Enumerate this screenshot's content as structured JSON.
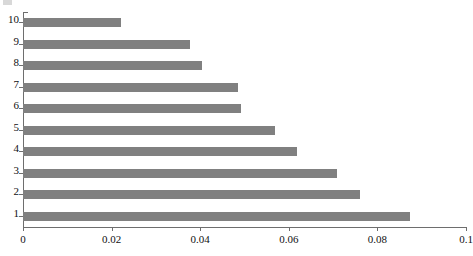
{
  "chart_data": {
    "type": "bar",
    "orientation": "horizontal",
    "title": "",
    "subtitle": "",
    "xlabel": "",
    "ylabel": "",
    "categories": [
      "1",
      "2",
      "3",
      "4",
      "5",
      "6",
      "7",
      "8",
      "9",
      "10"
    ],
    "values": [
      0.0874,
      0.0761,
      0.0709,
      0.0619,
      0.0569,
      0.0492,
      0.0485,
      0.0404,
      0.0377,
      0.0221
    ],
    "series": [
      {
        "name": "",
        "values": [
          0.0874,
          0.0761,
          0.0709,
          0.0619,
          0.0569,
          0.0492,
          0.0485,
          0.0404,
          0.0377,
          0.0221
        ]
      }
    ],
    "xlim": [
      0,
      0.1
    ],
    "xticks": [
      0,
      0.02,
      0.04,
      0.06,
      0.08,
      0.1
    ],
    "xtick_labels": [
      "0",
      "0.02",
      "0.04",
      "0.06",
      "0.08",
      "0.1"
    ],
    "ytick_labels_top_to_bottom": [
      "10",
      "9",
      "8",
      "7",
      "6",
      "5",
      "4",
      "3",
      "2",
      "1"
    ],
    "grid": false,
    "legend": null,
    "legend_position": "none",
    "bar_color": "#808080",
    "axis_color": "#6e6e6e",
    "background_color": "#ffffff",
    "annotations": []
  },
  "axis": {
    "x_ticks": [
      {
        "label": "0",
        "value": 0
      },
      {
        "label": "0.02",
        "value": 0.02
      },
      {
        "label": "0.04",
        "value": 0.04
      },
      {
        "label": "0.06",
        "value": 0.06
      },
      {
        "label": "0.08",
        "value": 0.08
      },
      {
        "label": "0.1",
        "value": 0.1
      }
    ],
    "y_ticks": [
      {
        "label": "10",
        "value": 0.0221
      },
      {
        "label": "9",
        "value": 0.0377
      },
      {
        "label": "8",
        "value": 0.0404
      },
      {
        "label": "7",
        "value": 0.0485
      },
      {
        "label": "6",
        "value": 0.0492
      },
      {
        "label": "5",
        "value": 0.0569
      },
      {
        "label": "4",
        "value": 0.0619
      },
      {
        "label": "3",
        "value": 0.0709
      },
      {
        "label": "2",
        "value": 0.0761
      },
      {
        "label": "1",
        "value": 0.0874
      }
    ]
  },
  "caption": {
    "text": ""
  }
}
